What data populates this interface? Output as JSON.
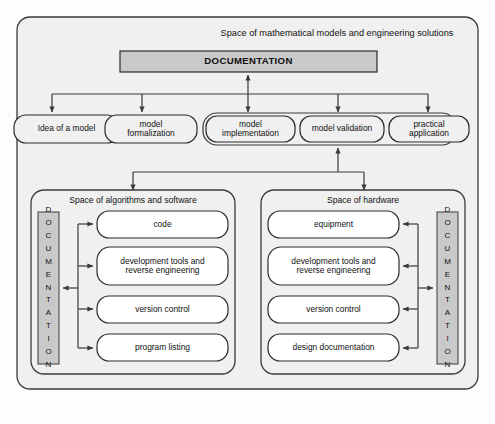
{
  "diagram": {
    "title": "Space of mathematical models and engineering solutions",
    "colors": {
      "page_background": "#fdfdfd",
      "container_fill": "#f0f0f0",
      "documentation_fill": "#c9c9c9",
      "node_fill": "#ffffff",
      "stroke": "#3a3a3a",
      "text": "#111111"
    },
    "top": {
      "documentation_bar": "DOCUMENTATION",
      "stages": [
        {
          "id": "idea",
          "label": "Idea of a model",
          "grouped": false
        },
        {
          "id": "formalization",
          "label": "model\nformalization",
          "grouped": false
        },
        {
          "id": "implementation",
          "label": "model\nimplementation",
          "grouped": true
        },
        {
          "id": "validation",
          "label": "model validation",
          "grouped": true
        },
        {
          "id": "application",
          "label": "practical\napplication",
          "grouped": true
        }
      ]
    },
    "spaces": [
      {
        "id": "algorithms",
        "title": "Space of algorithms and software",
        "documentation_label": "DOCUMENTATION",
        "documentation_side": "left",
        "items": [
          {
            "id": "code",
            "label": "code"
          },
          {
            "id": "dev-tools",
            "label": "development tools and\nreverse engineering"
          },
          {
            "id": "version-control",
            "label": "version control"
          },
          {
            "id": "program-listing",
            "label": "program listing"
          }
        ]
      },
      {
        "id": "hardware",
        "title": "Space of hardware",
        "documentation_label": "DOCUMENTATION",
        "documentation_side": "right",
        "items": [
          {
            "id": "equipment",
            "label": "equipment"
          },
          {
            "id": "dev-tools",
            "label": "development tools and\nreverse engineering"
          },
          {
            "id": "version-control",
            "label": "version control"
          },
          {
            "id": "design-documentation",
            "label": "design documentation"
          }
        ]
      }
    ]
  }
}
